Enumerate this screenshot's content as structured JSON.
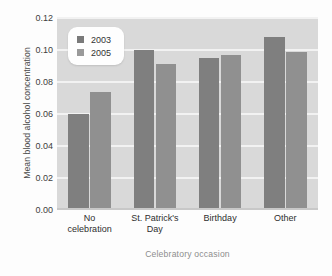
{
  "chart_data": {
    "type": "bar",
    "title": "",
    "xlabel": "Celebratory occasion",
    "ylabel": "Mean blood alcohol concentration",
    "categories": [
      "No celebration",
      "St. Patrick's Day",
      "Birthday",
      "Other"
    ],
    "category_lines": [
      [
        "No",
        "celebration"
      ],
      [
        "St. Patrick's",
        "Day"
      ],
      [
        "Birthday"
      ],
      [
        "Other"
      ]
    ],
    "series": [
      {
        "name": "2003",
        "color": "#7f7f7f",
        "values": [
          0.06,
          0.1,
          0.095,
          0.108
        ]
      },
      {
        "name": "2005",
        "color": "#909090",
        "values": [
          0.074,
          0.091,
          0.097,
          0.099
        ]
      }
    ],
    "ylim": [
      0.0,
      0.12
    ],
    "yticks": [
      0.0,
      0.02,
      0.04,
      0.06,
      0.08,
      0.1,
      0.12
    ],
    "ytick_labels": [
      "0.00",
      "0.02",
      "0.04",
      "0.06",
      "0.08",
      "0.10",
      "0.12"
    ],
    "grid": true,
    "grid_color": "#f2f2f2",
    "plot_background": "#d9d9d9",
    "legend_position": "top-left",
    "legend_entries": [
      "2003",
      "2005"
    ]
  }
}
